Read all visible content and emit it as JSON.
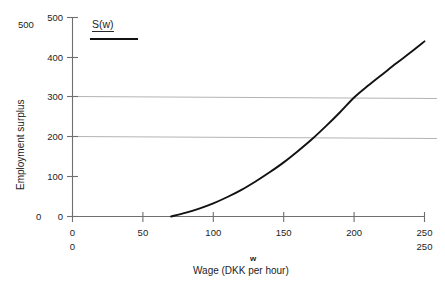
{
  "chart_data": {
    "type": "line",
    "title": "",
    "subtitle": "",
    "xlabel": "Wage (DKK per hour)",
    "xlabel_symbol": "w",
    "ylabel": "Employment surplus",
    "xlim": [
      0,
      250
    ],
    "ylim": [
      0,
      500
    ],
    "grid": "horizontal-only",
    "gridlines_y": [
      200,
      300
    ],
    "legend_position": "top-left-inside",
    "x_ticks": [
      0,
      50,
      100,
      150,
      200,
      250
    ],
    "x_tick_labels": [
      "0",
      "50",
      "100",
      "150",
      "200",
      "250"
    ],
    "x_ticks_secondary_labels": [
      "0",
      "",
      "",
      "",
      "",
      "250"
    ],
    "y_ticks": [
      0,
      100,
      200,
      300,
      400,
      500
    ],
    "y_tick_labels": [
      "0",
      "100",
      "200",
      "300",
      "400",
      "500"
    ],
    "y_outer_labels": [
      "500",
      "0"
    ],
    "series": [
      {
        "name": "S(w)",
        "color": "#121212",
        "x": [
          70,
          80,
          90,
          100,
          110,
          120,
          130,
          140,
          150,
          160,
          170,
          180,
          190,
          200,
          210,
          220,
          230,
          240,
          250
        ],
        "values": [
          0,
          9,
          20,
          33,
          49,
          67,
          88,
          111,
          136,
          164,
          194,
          227,
          262,
          299,
          329,
          357,
          385,
          412,
          440
        ]
      }
    ],
    "annotations": [
      {
        "text": "S(w)",
        "type": "legend-entry"
      }
    ]
  },
  "legend": {
    "label": "S(w)"
  },
  "axes": {
    "y_title": "Employment surplus",
    "x_title": "Wage (DKK per hour)",
    "x_symbol": "w"
  },
  "y_tick_text": {
    "t500": "500",
    "t400": "400",
    "t300": "300",
    "t200": "200",
    "t100": "100",
    "t0": "0"
  },
  "y_outer_text": {
    "top": "500",
    "bottom": "0"
  },
  "x_tick_text": {
    "t0": "0",
    "t50": "50",
    "t100": "100",
    "t150": "150",
    "t200": "200",
    "t250": "250"
  },
  "x_tick_text_row2": {
    "t0": "0",
    "t250": "250"
  },
  "colors": {
    "curve": "#121212",
    "axis": "#6f6f6f",
    "gridline": "#b4b4b4",
    "text": "#1d1d1d",
    "background": "#ffffff"
  }
}
